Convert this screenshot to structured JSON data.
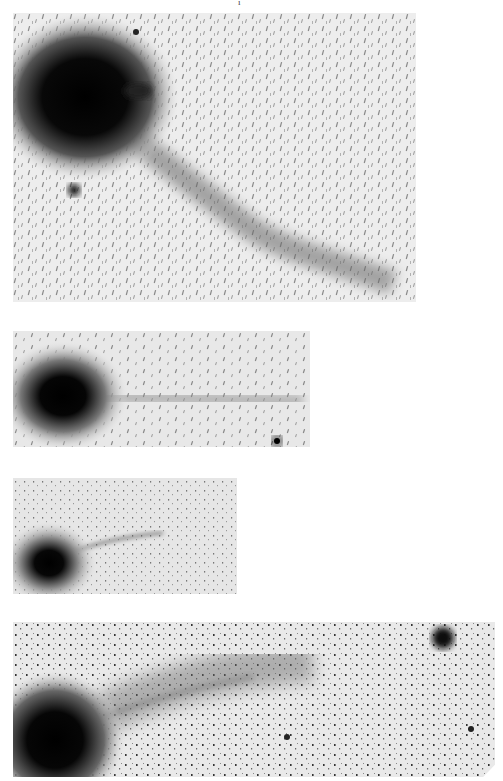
{
  "page": {
    "top_fragment": "i"
  },
  "figure": {
    "panels": [
      {
        "id": "panel-1",
        "box": [
          13,
          13,
          416,
          302
        ],
        "coma": {
          "cx": 85,
          "cy": 97,
          "r": 46
        },
        "tail": "curving band from coma toward lower right",
        "stars": [
          {
            "cx": 74,
            "cy": 190,
            "r": 6
          },
          {
            "cx": 136,
            "cy": 32,
            "r": 3
          }
        ]
      },
      {
        "id": "panel-2",
        "box": [
          13,
          331,
          310,
          447
        ],
        "coma": {
          "cx": 62,
          "cy": 396,
          "r": 26
        },
        "tail": "faint straight tail extending right",
        "stars": [
          {
            "cx": 277,
            "cy": 441,
            "r": 5
          }
        ]
      },
      {
        "id": "panel-3",
        "box": [
          13,
          478,
          237,
          594
        ],
        "coma": {
          "cx": 49,
          "cy": 563,
          "r": 17
        },
        "tail": "thin tail toward upper right",
        "stars": []
      },
      {
        "id": "panel-4",
        "box": [
          13,
          622,
          495,
          777
        ],
        "coma": {
          "cx": 55,
          "cy": 740,
          "r": 30
        },
        "tail": "broad diffuse tail toward upper right",
        "stars": [
          {
            "cx": 443,
            "cy": 638,
            "r": 11
          },
          {
            "cx": 287,
            "cy": 737,
            "r": 3
          },
          {
            "cx": 471,
            "cy": 729,
            "r": 3
          }
        ]
      }
    ]
  },
  "colors": {
    "background": "#ffffff",
    "sky": "#e6e6e6",
    "ink": "#0a0a0a"
  }
}
